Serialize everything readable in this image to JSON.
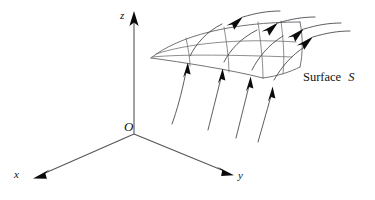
{
  "figure": {
    "type": "diagram",
    "width": 375,
    "height": 200,
    "background_color": "#ffffff",
    "line_color": "#55555a",
    "arrow_color": "#0b0b0b",
    "text_color": "#111111"
  },
  "axes": {
    "origin_label": "O",
    "x_label": "x",
    "y_label": "y",
    "z_label": "z",
    "origin_point": [
      134,
      134
    ],
    "x_endpoint": [
      34,
      178
    ],
    "y_endpoint": [
      233,
      175
    ],
    "z_endpoint": [
      134,
      12
    ]
  },
  "surface": {
    "label_text": "Surface",
    "label_symbol": "S",
    "mesh_rows": 3,
    "mesh_columns": 4
  },
  "flow": {
    "lines": 4,
    "arrowheads_below_surface": 4,
    "arrowheads_above_surface": 4,
    "direction": "upward through surface"
  }
}
